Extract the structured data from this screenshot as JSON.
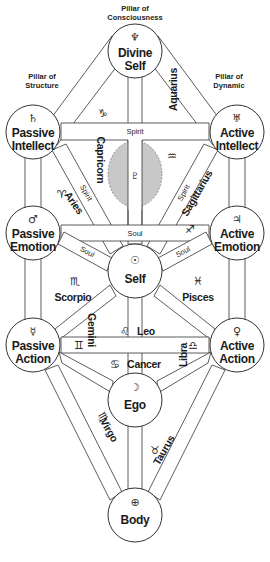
{
  "pillars": {
    "consciousness": {
      "line1": "Pillar of",
      "line2": "Consciousness"
    },
    "structure": {
      "line1": "Pillar of",
      "line2": "Structure"
    },
    "dynamic": {
      "line1": "Pillar of",
      "line2": "Dynamic"
    }
  },
  "nodes": {
    "divine_self": {
      "line1": "Divine",
      "line2": "Self",
      "glyph": "♆",
      "glyph_name": "neptune"
    },
    "passive_intellect": {
      "line1": "Passive",
      "line2": "Intellect",
      "glyph": "♄",
      "glyph_name": "saturn"
    },
    "active_intellect": {
      "line1": "Active",
      "line2": "Intellect",
      "glyph": "♅",
      "glyph_name": "uranus"
    },
    "passive_emotion": {
      "line1": "Passive",
      "line2": "Emotion",
      "glyph": "♂",
      "glyph_name": "mars"
    },
    "active_emotion": {
      "line1": "Active",
      "line2": "Emotion",
      "glyph": "♃",
      "glyph_name": "jupiter"
    },
    "self": {
      "line1": "Self",
      "glyph": "☉",
      "glyph_name": "sun"
    },
    "passive_action": {
      "line1": "Passive",
      "line2": "Action",
      "glyph": "☿",
      "glyph_name": "mercury"
    },
    "active_action": {
      "line1": "Active",
      "line2": "Action",
      "glyph": "♀",
      "glyph_name": "venus"
    },
    "ego": {
      "line1": "Ego",
      "glyph": "☽",
      "glyph_name": "moon"
    },
    "body": {
      "line1": "Body",
      "glyph": "⊕",
      "glyph_name": "earth"
    }
  },
  "hidden_node": {
    "glyph": "♇",
    "glyph_name": "pluto"
  },
  "path_labels": {
    "spirit_horizontal": "Spirit",
    "spirit_left": "Spirit",
    "spirit_right": "Spirit",
    "soul_horizontal": "Soul",
    "soul_left": "Soul",
    "soul_right": "Soul"
  },
  "zodiac": {
    "capricorn": {
      "label": "Capricorn",
      "glyph": "♑"
    },
    "aquarius": {
      "label": "Aquarius",
      "glyph": "♒"
    },
    "aries": {
      "label": "Aries",
      "glyph": "♈"
    },
    "sagittarius": {
      "label": "Sagittarius",
      "glyph": "♐"
    },
    "scorpio": {
      "label": "Scorpio",
      "glyph": "♏"
    },
    "pisces": {
      "label": "Pisces",
      "glyph": "♓"
    },
    "leo": {
      "label": "Leo",
      "glyph": "♌"
    },
    "gemini": {
      "label": "Gemini",
      "glyph": "♊"
    },
    "libra": {
      "label": "Libra",
      "glyph": "♎"
    },
    "cancer": {
      "label": "Cancer",
      "glyph": "♋"
    },
    "virgo": {
      "label": "Virgo",
      "glyph": "♍"
    },
    "taurus": {
      "label": "Taurus",
      "glyph": "♉"
    }
  },
  "colors": {
    "stroke": "#333333",
    "veil_fill": "#c8c8c8",
    "background": "#ffffff"
  }
}
